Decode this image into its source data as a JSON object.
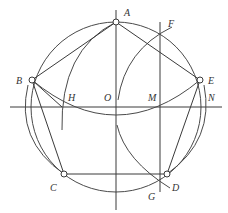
{
  "diagram": {
    "labels": {
      "A": "A",
      "B": "B",
      "C": "C",
      "D": "D",
      "E": "E",
      "F": "F",
      "G": "G",
      "H": "H",
      "M": "M",
      "N": "N",
      "O": "O"
    },
    "colors": {
      "stroke": "#3a3a3a",
      "text": "#333333",
      "background": "#ffffff"
    }
  }
}
